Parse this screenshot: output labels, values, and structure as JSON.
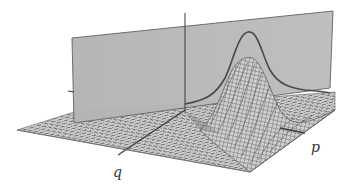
{
  "figure": {
    "axis_labels": {
      "q": "q",
      "p": "p"
    },
    "colors": {
      "plane_fill": "#b8b8b8",
      "plane_edge": "#6a6a6a",
      "mesh_line": "#555555",
      "mesh_fill": "#c4c4c4",
      "curve": "#4a4a4a",
      "axis": "#3a3a3a",
      "background": "#ffffff"
    }
  }
}
